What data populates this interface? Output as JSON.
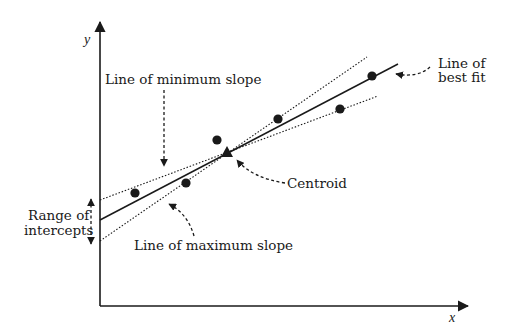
{
  "diagram": {
    "axes": {
      "x_label": "x",
      "y_label": "y"
    },
    "labels": {
      "min_slope": "Line of minimum slope",
      "max_slope": "Line of maximum slope",
      "best_fit_line1": "Line of",
      "best_fit_line2": "best fit",
      "centroid": "Centroid",
      "range_line1": "Range of",
      "range_line2": "intercepts"
    },
    "colors": {
      "ink": "#1a1a1a",
      "background": "#ffffff"
    },
    "data_points": [
      {
        "x": 135,
        "y": 193
      },
      {
        "x": 186,
        "y": 183
      },
      {
        "x": 217,
        "y": 140
      },
      {
        "x": 278,
        "y": 119
      },
      {
        "x": 340,
        "y": 109
      },
      {
        "x": 372,
        "y": 76
      }
    ],
    "centroid_point": {
      "x": 227,
      "y": 152
    },
    "lines": {
      "best_fit": {
        "style": "solid",
        "from": [
          100,
          220
        ],
        "to": [
          398,
          64
        ]
      },
      "min_slope": {
        "style": "dotted",
        "from": [
          100,
          200
        ],
        "to": [
          378,
          96
        ]
      },
      "max_slope": {
        "style": "dotted",
        "from": [
          100,
          241
        ],
        "to": [
          367,
          57
        ]
      }
    }
  }
}
